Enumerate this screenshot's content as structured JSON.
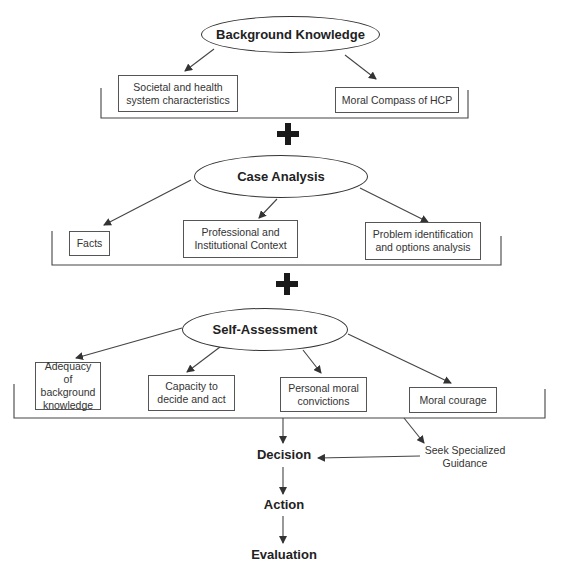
{
  "diagram": {
    "sections": [
      {
        "title": "Background Knowledge",
        "items": [
          "Societal and health system characteristics",
          "Moral Compass of HCP"
        ]
      },
      {
        "title": "Case Analysis",
        "items": [
          "Facts",
          "Professional and Institutional Context",
          "Problem identification and options analysis"
        ]
      },
      {
        "title": "Self-Assessment",
        "items": [
          "Adequacy of background knowledge",
          "Capacity to decide and act",
          "Personal moral convictions",
          "Moral courage"
        ]
      }
    ],
    "connector_symbol": "+",
    "flow": {
      "decision": "Decision",
      "action": "Action",
      "evaluation": "Evaluation",
      "side_branch": "Seek Specialized Guidance"
    }
  }
}
